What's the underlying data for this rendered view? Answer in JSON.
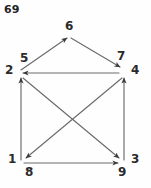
{
  "page": {
    "corner_label": "69",
    "background_color": "#fefefe",
    "ink_color": "#555555",
    "text_color": "#2a2a2a",
    "width": 151,
    "height": 188
  },
  "graph": {
    "kind": "directed-graph-sketch",
    "vertex_labels": [
      {
        "id": "v1",
        "text": "1",
        "x": 12,
        "y": 160
      },
      {
        "id": "v2",
        "text": "2",
        "x": 10,
        "y": 70
      },
      {
        "id": "v3",
        "text": "3",
        "x": 131,
        "y": 160
      },
      {
        "id": "v4",
        "text": "4",
        "x": 131,
        "y": 71
      },
      {
        "id": "v6",
        "text": "6",
        "x": 67,
        "y": 22
      }
    ],
    "edge_labels": [
      {
        "id": "e5",
        "text": "5",
        "x": 21,
        "y": 59
      },
      {
        "id": "e7",
        "text": "7",
        "x": 117,
        "y": 56
      },
      {
        "id": "e8",
        "text": "8",
        "x": 27,
        "y": 170
      },
      {
        "id": "e9",
        "text": "9",
        "x": 119,
        "y": 170
      }
    ],
    "edges": [
      {
        "id": "edge-5-6",
        "from": "v2",
        "to": "v6",
        "arrow_at": "to",
        "label": "5"
      },
      {
        "id": "edge-6-7",
        "from": "v6",
        "to": "v4",
        "arrow_at": "to",
        "label": "7"
      },
      {
        "id": "edge-4-2",
        "from": "v4",
        "to": "v2",
        "arrow_at": "to",
        "label": ""
      },
      {
        "id": "edge-1-2",
        "from": "v1",
        "to": "v2",
        "arrow_at": "to",
        "label": ""
      },
      {
        "id": "edge-3-4",
        "from": "v3",
        "to": "v4",
        "arrow_at": "to",
        "label": ""
      },
      {
        "id": "edge-1-3",
        "from": "v1",
        "to": "v3",
        "arrow_at": "to",
        "label": "8/9"
      },
      {
        "id": "edge-2-3",
        "from": "v2",
        "to": "v3",
        "arrow_at": "to",
        "label": ""
      },
      {
        "id": "edge-4-1",
        "from": "v4",
        "to": "v1",
        "arrow_at": "to",
        "label": ""
      }
    ]
  }
}
